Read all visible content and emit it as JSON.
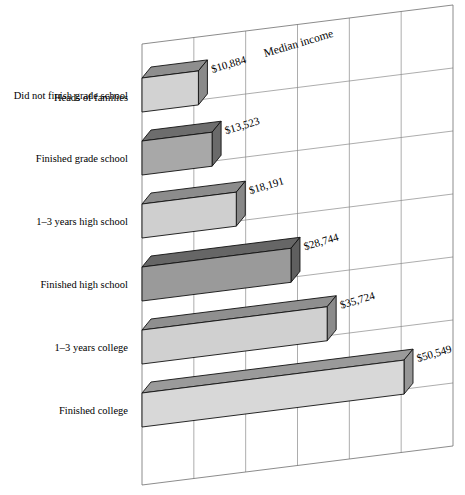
{
  "chart_data": {
    "type": "bar",
    "title": "",
    "axis_title": "Median income",
    "group_header": "Heads of families",
    "xlabel": "Median income",
    "ylabel": "",
    "orientation": "horizontal",
    "projection": "3d-sheared",
    "grid": true,
    "legend": "none",
    "xlim": [
      0,
      60000
    ],
    "gridline_step": 10000,
    "categories": [
      "Did not finish grade school",
      "Finished grade school",
      "1–3 years high school",
      "Finished high school",
      "1–3 years college",
      "Finished college"
    ],
    "values": [
      10884,
      13523,
      18191,
      28744,
      35724,
      50549
    ],
    "value_labels": [
      "$10,884",
      "$13,523",
      "$18,191",
      "$28,744",
      "$35,724",
      "$50,549"
    ],
    "bar_colors": [
      "#d2d2d2",
      "#a8a8a8",
      "#cfcfcf",
      "#9a9a9a",
      "#d0d0d0",
      "#d8d8d8"
    ],
    "bar_top_colors": [
      "#8e8e8e",
      "#6d6d6d",
      "#8c8c8c",
      "#666666",
      "#8f8f8f",
      "#9a9a9a"
    ],
    "bar_side_colors": [
      "#8a8a8a",
      "#6a6a6a",
      "#888888",
      "#5f5f5f",
      "#8b8b8b",
      "#969696"
    ],
    "grid_color": "#8a8a8a",
    "frame_color": "#6f6f6f",
    "text_color": "#000000",
    "background": "#ffffff"
  }
}
